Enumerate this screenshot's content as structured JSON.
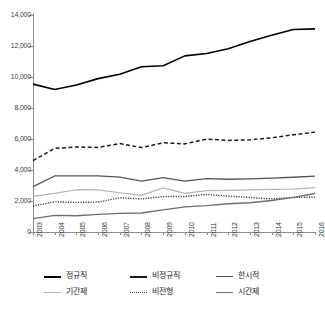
{
  "chart_data": {
    "type": "line",
    "title": "",
    "xlabel": "",
    "ylabel": "",
    "grid": false,
    "legend_position": "bottom",
    "ylim": [
      0,
      14000
    ],
    "ytick_values": [
      0,
      2000,
      4000,
      6000,
      8000,
      10000,
      12000,
      14000
    ],
    "ytick_labels": [
      "0",
      "2,000",
      "4,000",
      "6,000",
      "8,000",
      "10,000",
      "12,000",
      "14,000"
    ],
    "categories": [
      "2003",
      "2004",
      "2005",
      "2006",
      "2007",
      "2008",
      "2009",
      "2010",
      "2011",
      "2012",
      "2013",
      "2014",
      "2015",
      "2016"
    ],
    "x": [
      2003,
      2004,
      2005,
      2006,
      2007,
      2008,
      2009,
      2010,
      2011,
      2012,
      2013,
      2014,
      2015,
      2016
    ],
    "series": [
      {
        "name": "정규직",
        "style": "solid",
        "color": "#000000",
        "width": 1.6,
        "values": [
          9542,
          9190,
          9486,
          9894,
          10180,
          10658,
          10725,
          11362,
          11515,
          11823,
          12295,
          12699,
          13066,
          13108
        ]
      },
      {
        "name": "비정규직",
        "style": "dashed",
        "color": "#1a1a1a",
        "width": 1.5,
        "values": [
          4606,
          5394,
          5483,
          5457,
          5703,
          5445,
          5754,
          5685,
          5995,
          5911,
          5946,
          6077,
          6271,
          6444
        ]
      },
      {
        "name": "한시적",
        "style": "solid",
        "color": "#555555",
        "width": 1.3,
        "values": [
          2928,
          3615,
          3615,
          3626,
          3546,
          3288,
          3507,
          3281,
          3440,
          3404,
          3427,
          3479,
          3533,
          3603
        ]
      },
      {
        "name": "기간제",
        "style": "solid",
        "color": "#b5b5b5",
        "width": 1.2,
        "values": [
          2301,
          2490,
          2728,
          2722,
          2531,
          2365,
          2843,
          2496,
          2667,
          2680,
          2713,
          2754,
          2760,
          2867
        ]
      },
      {
        "name": "비전형",
        "style": "dotted",
        "color": "#3a3a3a",
        "width": 1.4,
        "values": [
          1678,
          1948,
          1907,
          1933,
          2208,
          2137,
          2283,
          2289,
          2427,
          2312,
          2229,
          2137,
          2229,
          2245
        ]
      },
      {
        "name": "시간제",
        "style": "solid",
        "color": "#6e6e6e",
        "width": 1.4,
        "values": [
          862,
          1072,
          1044,
          1135,
          1201,
          1226,
          1426,
          1620,
          1702,
          1826,
          1883,
          2035,
          2236,
          2488
        ]
      }
    ]
  },
  "legend": {
    "items": [
      {
        "label": "정규직",
        "style": "solid",
        "color": "#000000",
        "width": 2.0
      },
      {
        "label": "비정규직",
        "style": "solid",
        "color": "#1a1a1a",
        "width": 2.0
      },
      {
        "label": "한시적",
        "style": "solid",
        "color": "#555555",
        "width": 1.6
      },
      {
        "label": "기간제",
        "style": "solid",
        "color": "#b5b5b5",
        "width": 1.4
      },
      {
        "label": "비전형",
        "style": "dotted",
        "color": "#3a3a3a",
        "width": 1.6
      },
      {
        "label": "시간제",
        "style": "solid",
        "color": "#6e6e6e",
        "width": 1.8
      }
    ]
  }
}
